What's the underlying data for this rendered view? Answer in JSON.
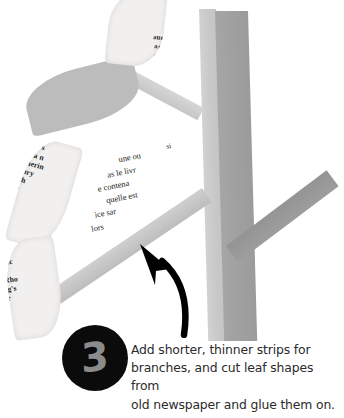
{
  "step": {
    "number": "3",
    "instruction_lines": [
      "Add shorter, thinner strips for",
      "branches, and cut leaf shapes from",
      "old newspaper and glue them on."
    ]
  },
  "colors": {
    "background": "#ffffff",
    "trunk_light": "#cdcdcd",
    "trunk_dark": "#a0a0a0",
    "branch_light": "#cfcfcf",
    "branch_dark": "#9d9d9d",
    "leaf_plain": "#bcbcbc",
    "newsprint_paper": "#f1f0ee",
    "badge_fill": "#0b0b0b",
    "badge_number": "#8b8b8b",
    "arrow": "#000000",
    "text": "#2b2b2b"
  },
  "collage": {
    "leaf_top_news_lines": [
      "(Tr),",
      "Dinah",
      "pe cho",
      "io inve",
      "the one",
      "M.",
      "ca."
    ],
    "leaf_mid_news_lines": [
      "ve",
      "ds or c",
      "Byrne's",
      "es of a n",
      "Catherin",
      "entury",
      "Both",
      "ury"
    ],
    "leaf_low_news_lines": [
      "to",
      "e 19",
      "t  lea",
      "attrac",
      "n.",
      "re Rho",
      "king's",
      "terr",
      "r"
    ],
    "news_block_lines": [
      "une ou",
      "as le livr",
      "e contena",
      "quelle est",
      "ice  sar",
      "lors"
    ],
    "news_block_superscript": "si"
  }
}
